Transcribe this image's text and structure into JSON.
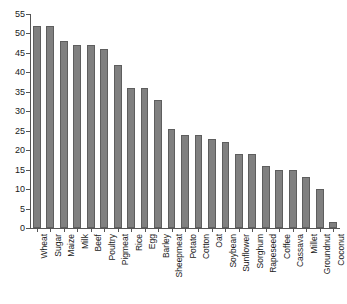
{
  "chart_data": {
    "type": "bar",
    "title": "",
    "subtitle": "",
    "xlabel": "",
    "ylabel": "",
    "ylim": [
      0,
      55
    ],
    "ytick_step": 5,
    "yticks": [
      0,
      5,
      10,
      15,
      20,
      25,
      30,
      35,
      40,
      45,
      50,
      55
    ],
    "grid": false,
    "legend": null,
    "bar_color": "#808080",
    "bar_edge_color": "#5e5e5e",
    "axis_color": "#555555",
    "categories": [
      "Wheat",
      "Sugar",
      "Maize",
      "Milk",
      "Beef",
      "Poultry",
      "Pigmeat",
      "Rice",
      "Egg",
      "Barley",
      "Sheepmeat",
      "Potato",
      "Cotton",
      "Oat",
      "Soybean",
      "Sunflower",
      "Sorghum",
      "Rapeseed",
      "Coffee",
      "Cassava",
      "Millet",
      "Groundnut",
      "Coconut"
    ],
    "values": [
      52,
      52,
      48,
      47,
      47,
      46,
      42,
      36,
      36,
      33,
      25.5,
      24,
      24,
      23,
      22,
      19,
      19,
      16,
      15,
      15,
      13,
      10,
      1.5
    ]
  }
}
